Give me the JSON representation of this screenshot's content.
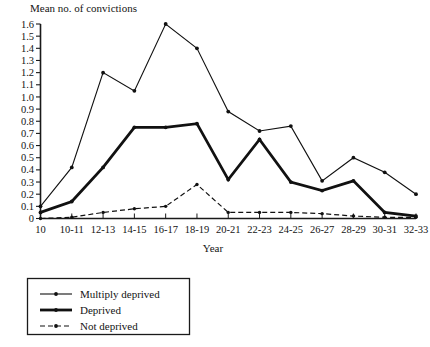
{
  "chart_data": {
    "type": "line",
    "title": "Mean no. of convictions",
    "xlabel": "Year",
    "ylabel": "Mean no. of convictions",
    "categories": [
      "10",
      "10-11",
      "12-13",
      "14-15",
      "16-17",
      "18-19",
      "20-21",
      "22-23",
      "24-25",
      "26-27",
      "28-29",
      "30-31",
      "32-33"
    ],
    "ylim": [
      0,
      1.6
    ],
    "xlim_note": "categorical, 13 ticks",
    "grid": false,
    "legend_position": "below-left",
    "y_ticks": [
      "0",
      "0.1",
      "0.2",
      "0.3",
      "0.4",
      "0.5",
      "0.6",
      "0.7",
      "0.8",
      "0.9",
      "1.0",
      "1.1",
      "1.2",
      "1.3",
      "1.4",
      "1.5",
      "1.6"
    ],
    "y_tick_values": [
      0,
      0.1,
      0.2,
      0.3,
      0.4,
      0.5,
      0.6,
      0.7,
      0.8,
      0.9,
      1.0,
      1.1,
      1.2,
      1.3,
      1.4,
      1.5,
      1.6
    ],
    "series": [
      {
        "name": "Multiply deprived",
        "style": "solid-thin",
        "values": [
          0.1,
          0.42,
          1.2,
          1.05,
          1.6,
          1.4,
          0.88,
          0.72,
          0.76,
          0.31,
          0.5,
          0.38,
          0.2
        ]
      },
      {
        "name": "Deprived",
        "style": "solid-thick",
        "values": [
          0.05,
          0.14,
          0.42,
          0.75,
          0.75,
          0.78,
          0.32,
          0.65,
          0.3,
          0.23,
          0.31,
          0.05,
          0.02
        ]
      },
      {
        "name": "Not deprived",
        "style": "dashed",
        "values": [
          0.0,
          0.01,
          0.05,
          0.08,
          0.1,
          0.28,
          0.05,
          0.05,
          0.05,
          0.04,
          0.02,
          0.01,
          0.01
        ]
      }
    ]
  },
  "legend": {
    "items": [
      {
        "label": "Multiply deprived",
        "style": "solid-thin"
      },
      {
        "label": "Deprived",
        "style": "solid-thick"
      },
      {
        "label": "Not deprived",
        "style": "dashed"
      }
    ]
  },
  "colors": {
    "ink": "#111111",
    "background": "#ffffff"
  }
}
